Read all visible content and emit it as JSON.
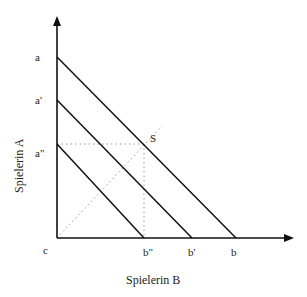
{
  "diagram": {
    "type": "budget-lines",
    "axes": {
      "y_label": "Spielerin A",
      "x_label": "Spielerin B",
      "origin_label": "c"
    },
    "y_ticks": [
      {
        "label": "a",
        "y": 57
      },
      {
        "label": "a'",
        "y": 100
      },
      {
        "label": "a\"",
        "y": 144
      }
    ],
    "x_ticks": [
      {
        "label": "b\"",
        "x": 144
      },
      {
        "label": "b'",
        "x": 192
      },
      {
        "label": "b",
        "x": 236
      }
    ],
    "lines": [
      {
        "name": "a-b",
        "from": "a",
        "to": "b"
      },
      {
        "name": "a'-b'",
        "from": "a'",
        "to": "b'"
      },
      {
        "name": "a''-b''",
        "from": "a\"",
        "to": "b\""
      }
    ],
    "point": {
      "label": "S"
    },
    "colors": {
      "line": "#111111",
      "dotted": "#9a9a9a"
    }
  }
}
